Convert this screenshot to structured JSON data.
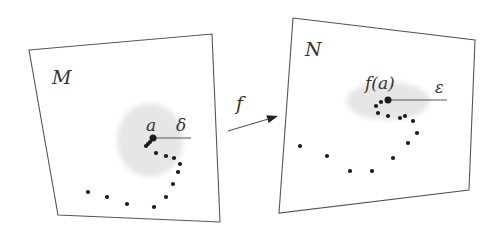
{
  "colors": {
    "stroke": "#555555",
    "dot": "#1a1a1a",
    "disc": "#e6e6e6",
    "text": "#333333"
  },
  "left_set": {
    "label": "M",
    "corners": [
      [
        29,
        50
      ],
      [
        212,
        34
      ],
      [
        220,
        222
      ],
      [
        58,
        215
      ]
    ],
    "label_pos": [
      52,
      68
    ],
    "neighborhood": {
      "cx": 150,
      "cy": 140,
      "rx": 33,
      "ry": 37
    },
    "point": {
      "label": "a",
      "x": 153,
      "y": 138,
      "label_pos": [
        146,
        117
      ]
    },
    "radius": {
      "label": "δ",
      "x1": 153,
      "y1": 138,
      "x2": 191,
      "y2": 138,
      "label_pos": [
        176,
        117
      ]
    },
    "sequence": [
      [
        150,
        142
      ],
      [
        148,
        144
      ],
      [
        146,
        146
      ],
      [
        156,
        153
      ],
      [
        166,
        156
      ],
      [
        174,
        158
      ],
      [
        180,
        164
      ],
      [
        178,
        172
      ],
      [
        173,
        184
      ],
      [
        166,
        197
      ],
      [
        154,
        207
      ],
      [
        127,
        204
      ],
      [
        107,
        197
      ],
      [
        88,
        192
      ]
    ]
  },
  "right_set": {
    "label": "N",
    "corners": [
      [
        293,
        18
      ],
      [
        475,
        40
      ],
      [
        469,
        190
      ],
      [
        279,
        213
      ]
    ],
    "label_pos": [
      305,
      40
    ],
    "neighborhood": {
      "cx": 388,
      "cy": 101,
      "rx": 42,
      "ry": 19
    },
    "point": {
      "label": "f(a)",
      "x": 388,
      "y": 100,
      "label_pos": [
        365,
        75
      ]
    },
    "radius": {
      "label": "ε",
      "x1": 388,
      "y1": 100,
      "x2": 447,
      "y2": 100,
      "label_pos": [
        435,
        80
      ]
    },
    "sequence": [
      [
        381,
        102
      ],
      [
        376,
        106
      ],
      [
        378,
        113
      ],
      [
        388,
        116
      ],
      [
        400,
        118
      ],
      [
        405,
        116
      ],
      [
        413,
        121
      ],
      [
        417,
        133
      ],
      [
        408,
        143
      ],
      [
        393,
        158
      ],
      [
        372,
        171
      ],
      [
        350,
        171
      ],
      [
        327,
        156
      ],
      [
        300,
        146
      ]
    ]
  },
  "map": {
    "label": "f",
    "x1": 228,
    "y1": 131,
    "x2": 278,
    "y2": 116,
    "label_pos": [
      236,
      94
    ]
  }
}
